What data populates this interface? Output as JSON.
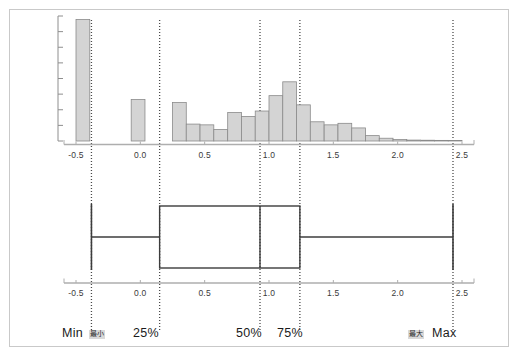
{
  "figure": {
    "background_color": "#ffffff",
    "frame_color": "#c9c9c9",
    "bar_fill": "#d4d4d4",
    "bar_stroke": "#8a8a8a",
    "axis_color": "#aeaeae",
    "marker_line_color": "#4a4a4a",
    "box_stroke": "#3c3c3c"
  },
  "chart_data": [
    {
      "type": "bar",
      "name": "histogram",
      "title": "",
      "xlabel": "",
      "ylabel": "",
      "xlim": [
        -0.5,
        2.5
      ],
      "ylim": [
        0,
        8
      ],
      "grid": false,
      "legend": "none",
      "xticks": [
        "-0.5",
        "0.0",
        "0.5",
        "1.0",
        "1.5",
        "2.0",
        "2.5"
      ],
      "xtick_values": [
        -0.5,
        0.0,
        0.5,
        1.0,
        1.5,
        2.0,
        2.5
      ],
      "ytick_count": 8,
      "bin_width": 0.107,
      "bin_starts": [
        -0.5,
        -0.393,
        -0.286,
        -0.179,
        -0.071,
        0.036,
        0.143,
        0.25,
        0.357,
        0.464,
        0.571,
        0.679,
        0.786,
        0.893,
        1.0,
        1.107,
        1.214,
        1.321,
        1.429,
        1.536,
        1.643,
        1.75,
        1.857,
        1.964,
        2.071,
        2.179,
        2.286,
        2.393
      ],
      "values": [
        7.9,
        0,
        0,
        0,
        2.7,
        0,
        0,
        2.5,
        1.1,
        1.05,
        0.75,
        1.85,
        1.6,
        1.95,
        2.95,
        3.85,
        2.35,
        1.25,
        1.05,
        1.15,
        0.85,
        0.35,
        0.18,
        0.1,
        0.06,
        0.05,
        0.04,
        0.03
      ],
      "categories": [
        "-0.5",
        "-0.39",
        "-0.29",
        "-0.18",
        "-0.07",
        "0.04",
        "0.14",
        "0.25",
        "0.36",
        "0.46",
        "0.57",
        "0.68",
        "0.79",
        "0.89",
        "1.00",
        "1.11",
        "1.21",
        "1.32",
        "1.43",
        "1.54",
        "1.64",
        "1.75",
        "1.86",
        "1.96",
        "2.07",
        "2.18",
        "2.29",
        "2.39"
      ]
    },
    {
      "type": "boxplot",
      "name": "boxplot",
      "title": "",
      "xlabel": "",
      "ylabel": "",
      "xlim": [
        -0.5,
        2.5
      ],
      "grid": false,
      "legend": "none",
      "xticks": [
        "-0.5",
        "0.0",
        "0.5",
        "1.0",
        "1.5",
        "2.0",
        "2.5"
      ],
      "xtick_values": [
        -0.5,
        0.0,
        0.5,
        1.0,
        1.5,
        2.0,
        2.5
      ],
      "min": -0.38,
      "q1": 0.15,
      "median": 0.93,
      "q3": 1.24,
      "max": 2.43
    }
  ],
  "histogram_axis": {
    "ticks": [
      {
        "label": "-0.5",
        "value": -0.5
      },
      {
        "label": "0.0",
        "value": 0.0
      },
      {
        "label": "0.5",
        "value": 0.5
      },
      {
        "label": "1.0",
        "value": 1.0
      },
      {
        "label": "1.5",
        "value": 1.5
      },
      {
        "label": "2.0",
        "value": 2.0
      },
      {
        "label": "2.5",
        "value": 2.5
      }
    ]
  },
  "boxplot_axis": {
    "ticks": [
      {
        "label": "-0.5",
        "value": -0.5
      },
      {
        "label": "0.0",
        "value": 0.0
      },
      {
        "label": "0.5",
        "value": 0.5
      },
      {
        "label": "1.0",
        "value": 1.0
      },
      {
        "label": "1.5",
        "value": 1.5
      },
      {
        "label": "2.0",
        "value": 2.0
      },
      {
        "label": "2.5",
        "value": 2.5
      }
    ]
  },
  "markers": {
    "min": {
      "label": "Min",
      "jp": "最小",
      "value": -0.38
    },
    "q1": {
      "label": "25%",
      "value": 0.15
    },
    "median": {
      "label": "50%",
      "value": 0.93
    },
    "q3": {
      "label": "75%",
      "value": 1.24
    },
    "max": {
      "label": "Max",
      "jp": "最大",
      "value": 2.43
    }
  }
}
